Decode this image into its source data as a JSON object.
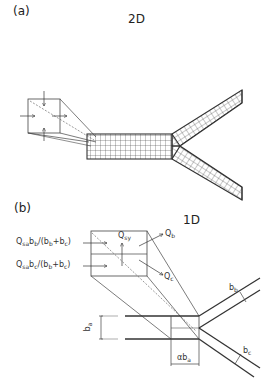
{
  "panel_a": {
    "label": "(a)",
    "title": "2D"
  },
  "panel_b": {
    "label": "(b)",
    "title": "1D",
    "flux_inlet_b": {
      "main": "Q",
      "sub1": "sa",
      "mid": "b",
      "sub2": "b",
      "rest": "/(b",
      "sub3": "b",
      "plus": "+b",
      "sub4": "c",
      "close": ")"
    },
    "flux_inlet_c": {
      "main": "Q",
      "sub1": "sa",
      "mid": "b",
      "sub2": "c",
      "rest": "/(b",
      "sub3": "b",
      "plus": "+b",
      "sub4": "c",
      "close": ")"
    },
    "q_sy": {
      "main": "Q",
      "sub": "sy"
    },
    "q_b": {
      "main": "Q",
      "sub": "b"
    },
    "q_c": {
      "main": "Q",
      "sub": "c"
    },
    "width_a": {
      "main": "b",
      "sub": "a"
    },
    "width_b": {
      "main": "b",
      "sub": "b"
    },
    "width_c": {
      "main": "b",
      "sub": "c"
    },
    "junction_length": {
      "main": "αb",
      "sub": "a"
    }
  },
  "colors": {
    "line": "#333333",
    "thin_line": "#555555",
    "mesh": "#444444",
    "background": "#ffffff"
  }
}
